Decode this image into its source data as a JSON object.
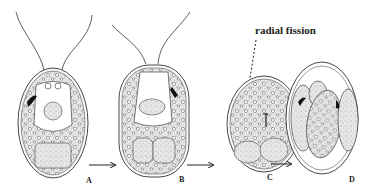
{
  "figure": {
    "annotation": "radial fission",
    "stages": [
      {
        "label": "A",
        "description": "biflagellate cell"
      },
      {
        "label": "B",
        "description": "flagellate cell with dividing protoplast"
      },
      {
        "label": "C",
        "description": "rounded cell undergoing radial fission"
      },
      {
        "label": "D",
        "description": "daughter cells within parent wall"
      }
    ],
    "colors": {
      "ink": "#222222",
      "stipple": "#9a9a9a",
      "background": "#ffffff"
    }
  }
}
